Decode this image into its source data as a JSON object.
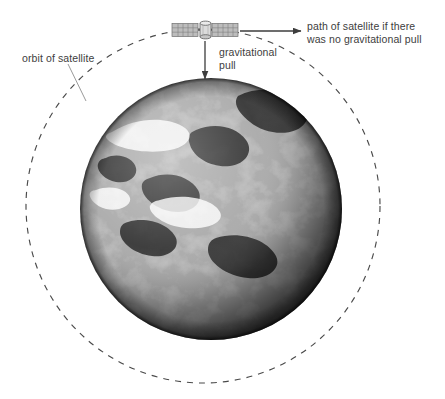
{
  "diagram": {
    "background_color": "#ffffff",
    "text_color": "#3d3d3d",
    "labels": {
      "path_no_gravity": "path of satellite if there\nwas no gravitational pull",
      "gravitational_pull": "gravitational\npull",
      "orbit_of_satellite": "orbit of satellite"
    },
    "objects": {
      "earth_name": "earth",
      "satellite_name": "satellite",
      "orbit_name": "orbit-path"
    },
    "geometry": {
      "orbit_center_x": 203,
      "orbit_center_y": 206,
      "orbit_radius": 177,
      "earth_center_x": 211,
      "earth_center_y": 209,
      "earth_radius": 131,
      "satellite_x": 205,
      "satellite_y": 30,
      "tangent_arrow_from_x": 240,
      "tangent_arrow_to_x": 301,
      "tangent_arrow_y": 31,
      "gravity_arrow_x": 205,
      "gravity_arrow_from_y": 40,
      "gravity_arrow_to_y": 79
    },
    "colors": {
      "orbit_dash": "#4a4a4a",
      "arrow": "#3d3d3d",
      "leader_line": "#8c8c8c",
      "earth_dark": "#000000",
      "earth_light": "#e8e8e8",
      "satellite_panel": "#b8b8b8",
      "satellite_body": "#d8d8d8"
    }
  }
}
